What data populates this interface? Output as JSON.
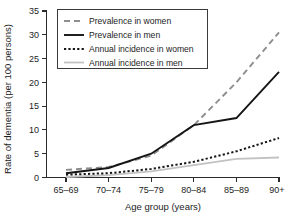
{
  "chart_data": {
    "type": "line",
    "title": "",
    "xlabel": "Age group (years)",
    "ylabel": "Rate of dementia (per 100 persons)",
    "categories": [
      "65–69",
      "70–74",
      "75–79",
      "80–84",
      "85–89",
      "90+"
    ],
    "x_tick_labels": [
      "65–69",
      "70–74",
      "75–79",
      "80–84",
      "85–89",
      "90+"
    ],
    "y_tick_labels": [
      "0",
      "5",
      "10",
      "15",
      "20",
      "25",
      "30",
      "35"
    ],
    "y_ticks": [
      0,
      5,
      10,
      15,
      20,
      25,
      30,
      35
    ],
    "ylim": [
      0,
      35
    ],
    "grid": false,
    "legend_position": "top-left",
    "series": [
      {
        "name": "Prevalence in women",
        "values": [
          1.6,
          2.2,
          4.6,
          11.0,
          20.0,
          30.5
        ],
        "style": "dashed",
        "color": "#8e8e8e"
      },
      {
        "name": "Prevalence in men",
        "values": [
          0.9,
          2.0,
          5.0,
          11.0,
          12.5,
          22.2
        ],
        "style": "solid",
        "color": "#151515"
      },
      {
        "name": "Annual incidence in women",
        "values": [
          0.6,
          0.9,
          1.8,
          3.3,
          5.5,
          8.3
        ],
        "style": "dotted",
        "color": "#151515"
      },
      {
        "name": "Annual incidence in men",
        "values": [
          0.1,
          0.5,
          1.3,
          2.6,
          3.9,
          4.2
        ],
        "style": "solid",
        "color": "#c2c2c2"
      }
    ]
  },
  "legend": {
    "items": [
      {
        "label": "Prevalence in women"
      },
      {
        "label": "Prevalence in men"
      },
      {
        "label": "Annual incidence in women"
      },
      {
        "label": "Annual incidence in men"
      }
    ]
  }
}
